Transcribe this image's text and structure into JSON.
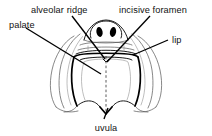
{
  "figure": {
    "background_color": "#ffffff",
    "ink_color": "#000000",
    "width": 212,
    "height": 136
  },
  "labels": {
    "palate": "palate",
    "alveolar_ridge": "alveolar ridge",
    "incisive_foramen": "incisive foramen",
    "lip": "lip",
    "uvula": "uvula"
  },
  "parts": {
    "nose": "nose",
    "nostril_left": "left nostril",
    "nostril_right": "right nostril",
    "upper_lip": "upper lip",
    "lower_lip": "lower lip",
    "cheek_left": "left cheek",
    "cheek_right": "right cheek",
    "hard_palate": "hard palate",
    "soft_palate": "soft palate",
    "midline": "palatal midline raphe",
    "mouth_opening": "mouth opening"
  }
}
